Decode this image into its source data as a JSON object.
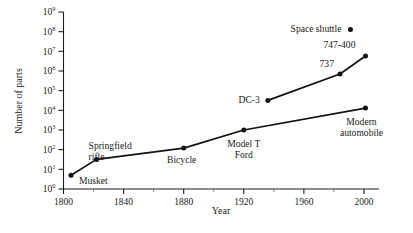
{
  "chart_data": {
    "type": "line",
    "title": "",
    "xlabel": "Year",
    "ylabel": "Number of parts",
    "xlim": [
      1800,
      2010
    ],
    "ylim": [
      1,
      1000000000
    ],
    "yscale": "log",
    "grid": false,
    "legend": "none",
    "xticks": [
      1800,
      1840,
      1880,
      1920,
      1960,
      2000
    ],
    "xtick_labels": [
      "1800",
      "1840",
      "1880",
      "1920",
      "1960",
      "2000"
    ],
    "x_minor_ticks": [
      1820,
      1860,
      1900,
      1940,
      1980
    ],
    "yticks": [
      1,
      10,
      100,
      1000,
      10000,
      100000,
      1000000,
      10000000,
      100000000,
      1000000000
    ],
    "ytick_labels": [
      {
        "base": "10",
        "exp": "0"
      },
      {
        "base": "10",
        "exp": "1"
      },
      {
        "base": "10",
        "exp": "2"
      },
      {
        "base": "10",
        "exp": "3"
      },
      {
        "base": "10",
        "exp": "4"
      },
      {
        "base": "10",
        "exp": "5"
      },
      {
        "base": "10",
        "exp": "6"
      },
      {
        "base": "10",
        "exp": "7"
      },
      {
        "base": "10",
        "exp": "8"
      },
      {
        "base": "10",
        "exp": "9"
      }
    ],
    "series": [
      {
        "name": "Ground vehicles / firearms",
        "points": [
          {
            "label": "Musket",
            "x": 1805,
            "y": 5,
            "label_dx": 8,
            "label_dy": 9,
            "anchor": "start"
          },
          {
            "label": "Springfield rifle",
            "x": 1822,
            "y": 32,
            "label_dx": -8,
            "label_dy": -10,
            "anchor": "start"
          },
          {
            "label": "Bicycle",
            "x": 1880,
            "y": 120,
            "label_dx": -2,
            "label_dy": 15,
            "anchor": "middle"
          },
          {
            "label": "Model T Ford",
            "x": 1920,
            "y": 1000,
            "label_dx": 0,
            "label_dy": 17,
            "anchor": "middle"
          },
          {
            "label": "Modern automobile",
            "x": 2001,
            "y": 13000,
            "label_dx": -4,
            "label_dy": 17,
            "anchor": "middle"
          }
        ]
      },
      {
        "name": "Aircraft",
        "points": [
          {
            "label": "DC-3",
            "x": 1936,
            "y": 32000,
            "label_dx": -8,
            "label_dy": 3,
            "anchor": "end"
          },
          {
            "label": "737",
            "x": 1984,
            "y": 700000,
            "label_dx": -6,
            "label_dy": -7,
            "anchor": "end"
          },
          {
            "label": "747-400",
            "x": 2001,
            "y": 5800000,
            "label_dx": -10,
            "label_dy": -8,
            "anchor": "end"
          }
        ]
      },
      {
        "name": "Spacecraft",
        "points": [
          {
            "label": "Space shuttle",
            "x": 1991,
            "y": 130000000,
            "label_dx": -9,
            "label_dy": 3,
            "anchor": "end"
          }
        ]
      }
    ]
  },
  "labels": {
    "x_axis_title": "Year",
    "y_axis_title": "Number of parts"
  }
}
